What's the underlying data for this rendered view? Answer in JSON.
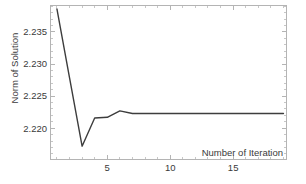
{
  "chart_data": {
    "type": "line",
    "title": "",
    "xlabel": "Number of Iteration",
    "ylabel": "Norm of Solution",
    "x": [
      1,
      2,
      3,
      4,
      5,
      6,
      7,
      8,
      9,
      10,
      11,
      12,
      13,
      14,
      15,
      16,
      17,
      18,
      19
    ],
    "y": [
      2.2386,
      2.2279,
      2.2172,
      2.2216,
      2.2217,
      2.2227,
      2.2223,
      2.2223,
      2.2223,
      2.2223,
      2.2223,
      2.2223,
      2.2223,
      2.2223,
      2.2223,
      2.2223,
      2.2223,
      2.2223,
      2.2223
    ],
    "xlim": [
      0.45,
      19.2
    ],
    "ylim": [
      2.2152,
      2.2392
    ],
    "grid": false,
    "legend": "none",
    "x_ticks": {
      "major": [
        {
          "value": 5,
          "label": "5"
        },
        {
          "value": 10,
          "label": "10"
        },
        {
          "value": 15,
          "label": "15"
        }
      ],
      "minor": [
        1,
        2,
        3,
        4,
        6,
        7,
        8,
        9,
        11,
        12,
        13,
        14,
        16,
        17,
        18,
        19
      ]
    },
    "y_ticks": {
      "major": [
        {
          "value": 2.235,
          "label": "2.235"
        },
        {
          "value": 2.23,
          "label": "2.230"
        },
        {
          "value": 2.225,
          "label": "2.225"
        },
        {
          "value": 2.22,
          "label": "2.220"
        }
      ],
      "minor": [
        2.216,
        2.217,
        2.218,
        2.219,
        2.221,
        2.222,
        2.223,
        2.224,
        2.226,
        2.227,
        2.228,
        2.229,
        2.231,
        2.232,
        2.233,
        2.234,
        2.236,
        2.237,
        2.238,
        2.239
      ]
    },
    "colors": {
      "line": "#3d3d3d",
      "frame": "#b4b4b4",
      "text": "#3a3a3a",
      "background": "#ffffff"
    }
  }
}
